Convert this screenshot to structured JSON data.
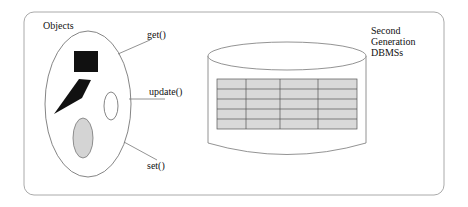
{
  "figure": {
    "objects_label": "Objects",
    "methods": {
      "get": "get()",
      "update": "update()",
      "set": "set()"
    },
    "dbms_label_lines": [
      "Second",
      "Generation",
      "DBMSs"
    ],
    "table": {
      "rows": 5,
      "cols": 4,
      "fill": "#d9d9d9",
      "line": "#555555"
    },
    "colors": {
      "frame": "#aaaaaa",
      "outline": "#666666",
      "dark_shape": "#111111",
      "grey_ellipse": "#d4d4d4"
    }
  }
}
